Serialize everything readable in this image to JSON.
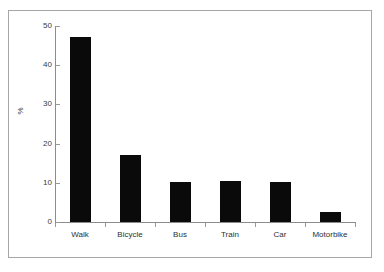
{
  "chart_data": {
    "type": "bar",
    "title": "",
    "subtitle": "",
    "xlabel": "",
    "ylabel": "%",
    "categories": [
      "Walk",
      "Bicycle",
      "Bus",
      "Train",
      "Car",
      "Motorbike"
    ],
    "values": [
      47.3,
      17.1,
      10.2,
      10.5,
      10.2,
      2.6
    ],
    "series": [
      {
        "name": "Percentage",
        "values": [
          47.3,
          17.1,
          10.2,
          10.5,
          10.2,
          2.6
        ]
      }
    ],
    "ylim": [
      0,
      50
    ],
    "yticks": [
      0,
      10,
      20,
      30,
      40,
      50
    ],
    "ytick_labels": [
      "0",
      "10",
      "20",
      "30",
      "40",
      "50"
    ],
    "grid": false,
    "legend": null,
    "legend_position": "none",
    "annotations": [],
    "bar_color": "#0a0a0a",
    "axis_color": "#8c8c8c",
    "background_color": "#ffffff"
  },
  "figure": {
    "border_color": "#a6a6a6"
  }
}
